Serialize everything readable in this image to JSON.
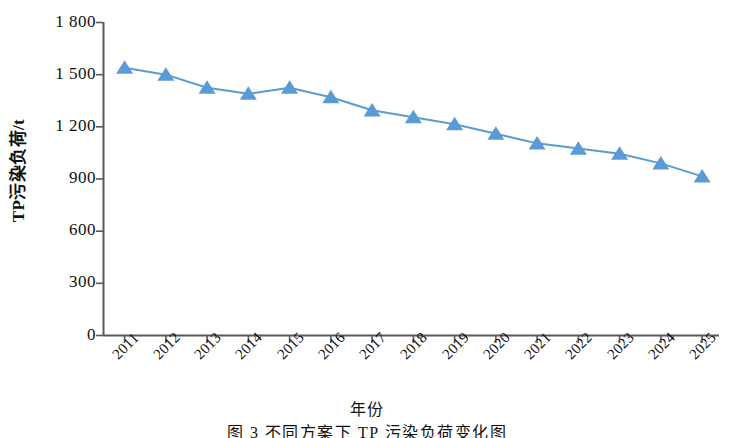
{
  "chart_data": {
    "type": "line",
    "title": "",
    "xlabel": "年份",
    "ylabel": "TP污染负荷/t",
    "categories": [
      "2011",
      "2012",
      "2013",
      "2014",
      "2015",
      "2016",
      "2017",
      "2018",
      "2019",
      "2020",
      "2021",
      "2022",
      "2023",
      "2024",
      "2025"
    ],
    "values": [
      1540,
      1500,
      1425,
      1390,
      1425,
      1370,
      1295,
      1255,
      1215,
      1160,
      1105,
      1075,
      1045,
      990,
      915
    ],
    "series": [
      {
        "name": "TP污染负荷",
        "values": [
          1540,
          1500,
          1425,
          1390,
          1425,
          1370,
          1295,
          1255,
          1215,
          1160,
          1105,
          1075,
          1045,
          990,
          915
        ]
      }
    ],
    "ylim": [
      0,
      1800
    ],
    "yticks": [
      0,
      300,
      600,
      900,
      1200,
      1500,
      1800
    ],
    "ytick_labels": [
      "0",
      "300",
      "600",
      "900",
      "1 200",
      "1 500",
      "1 800"
    ],
    "grid": false,
    "legend": "none",
    "marker": "triangle",
    "line_color": "#5B9BD5",
    "marker_color": "#5B9BD5",
    "axis_color": "#595959"
  },
  "axes": {
    "y_title": "TP污染负荷/t",
    "x_title": "年份",
    "y_tick_labels": [
      "1 800",
      "1 500",
      "1 200",
      "900",
      "600",
      "300",
      "0"
    ],
    "x_tick_labels": [
      "2011",
      "2012",
      "2013",
      "2014",
      "2015",
      "2016",
      "2017",
      "2018",
      "2019",
      "2020",
      "2021",
      "2022",
      "2023",
      "2024",
      "2025"
    ]
  },
  "caption": {
    "text": "图 3   不同方案下 TP 污染负荷变化图"
  }
}
